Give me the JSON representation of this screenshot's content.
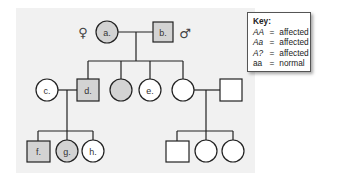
{
  "key": {
    "title": "Key:",
    "rows": [
      {
        "genotype": "AA",
        "eq": "=",
        "phenotype": "affected"
      },
      {
        "genotype": "Aa",
        "eq": "=",
        "phenotype": "affected"
      },
      {
        "genotype": "A?",
        "eq": "=",
        "phenotype": "affected"
      },
      {
        "genotype": "aa",
        "eq": "=",
        "phenotype": "normal"
      }
    ]
  },
  "symbols": {
    "female": "♀",
    "male": "♂"
  },
  "colors": {
    "affected": "#d3d3d3",
    "unaffected": "#ffffff",
    "line": "#222222",
    "panel": "#f1f1f1"
  },
  "individuals": {
    "a": {
      "label": "a.",
      "sex": "female",
      "affected": true,
      "generation": 1
    },
    "b": {
      "label": "b.",
      "sex": "male",
      "affected": true,
      "generation": 1
    },
    "c": {
      "label": "c.",
      "sex": "female",
      "affected": false,
      "generation": 2
    },
    "d": {
      "label": "d.",
      "sex": "male",
      "affected": true,
      "generation": 2
    },
    "unlabeled_affected_female": {
      "label": "",
      "sex": "female",
      "affected": true,
      "generation": 2
    },
    "e": {
      "label": "e.",
      "sex": "female",
      "affected": false,
      "generation": 2
    },
    "unlabeled_female_gen2": {
      "label": "",
      "sex": "female",
      "affected": false,
      "generation": 2
    },
    "unlabeled_male_spouse": {
      "label": "",
      "sex": "male",
      "affected": false,
      "generation": 2
    },
    "f": {
      "label": "f.",
      "sex": "male",
      "affected": true,
      "generation": 3
    },
    "g": {
      "label": "g.",
      "sex": "female",
      "affected": true,
      "generation": 3
    },
    "h": {
      "label": "h.",
      "sex": "female",
      "affected": false,
      "generation": 3
    },
    "unlabeled_male_gen3": {
      "label": "",
      "sex": "male",
      "affected": false,
      "generation": 3
    },
    "unlabeled_female_gen3_1": {
      "label": "",
      "sex": "female",
      "affected": false,
      "generation": 3
    },
    "unlabeled_female_gen3_2": {
      "label": "",
      "sex": "female",
      "affected": false,
      "generation": 3
    }
  }
}
